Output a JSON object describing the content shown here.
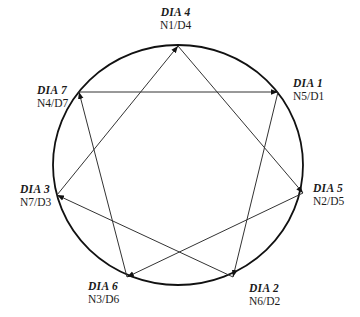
{
  "diagram": {
    "type": "cyclic-heptagram",
    "circle": {
      "cx": 178,
      "cy": 165,
      "rx": 125,
      "ry": 120,
      "stroke": "#111111"
    },
    "line_color": "#333333",
    "nodes": [
      {
        "id": "dia4",
        "title": "DIA 4",
        "sub": "N1/D4",
        "x": 178,
        "y": 46,
        "label_x": 160,
        "label_y": 6,
        "align": "center"
      },
      {
        "id": "dia1",
        "title": "DIA 1",
        "sub": "N5/D1",
        "x": 278,
        "y": 92,
        "label_x": 293,
        "label_y": 77,
        "align": "left"
      },
      {
        "id": "dia5",
        "title": "DIA 5",
        "sub": "N2/D5",
        "x": 303,
        "y": 193,
        "label_x": 313,
        "label_y": 182,
        "align": "left"
      },
      {
        "id": "dia2",
        "title": "DIA 2",
        "sub": "N6/D2",
        "x": 233,
        "y": 277,
        "label_x": 249,
        "label_y": 282,
        "align": "left"
      },
      {
        "id": "dia6",
        "title": "DIA 6",
        "sub": "N3/D6",
        "x": 127,
        "y": 277,
        "label_x": 88,
        "label_y": 280,
        "align": "left"
      },
      {
        "id": "dia3",
        "title": "DIA 3",
        "sub": "N7/D3",
        "x": 57,
        "y": 195,
        "label_x": 20,
        "label_y": 183,
        "align": "left"
      },
      {
        "id": "dia7",
        "title": "DIA 7",
        "sub": "N4/D7",
        "x": 79,
        "y": 92,
        "label_x": 37,
        "label_y": 84,
        "align": "left"
      }
    ],
    "edges": [
      {
        "from": "dia1",
        "to": "dia2"
      },
      {
        "from": "dia2",
        "to": "dia3"
      },
      {
        "from": "dia3",
        "to": "dia4"
      },
      {
        "from": "dia4",
        "to": "dia5"
      },
      {
        "from": "dia5",
        "to": "dia6"
      },
      {
        "from": "dia6",
        "to": "dia7"
      },
      {
        "from": "dia7",
        "to": "dia1"
      }
    ]
  }
}
